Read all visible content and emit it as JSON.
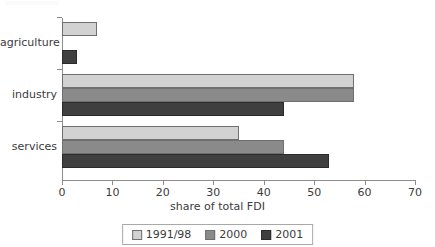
{
  "chart_data": {
    "type": "bar",
    "orientation": "horizontal",
    "title": "",
    "xlabel": "share of total FDI",
    "ylabel": "",
    "categories": [
      "agriculture",
      "industry",
      "services"
    ],
    "series": [
      {
        "name": "1991/98",
        "color": "#d2d2d2",
        "values": [
          7,
          58,
          35
        ]
      },
      {
        "name": "2000",
        "color": "#8a8a8a",
        "values": [
          0,
          58,
          44
        ]
      },
      {
        "name": "2001",
        "color": "#3f3f3f",
        "values": [
          3,
          44,
          53
        ]
      }
    ],
    "xlim": [
      0,
      70
    ],
    "xticks": [
      0,
      10,
      20,
      30,
      40,
      50,
      60,
      70
    ],
    "xtick_labels": [
      "0",
      "10",
      "20",
      "30",
      "40",
      "50",
      "60",
      "70"
    ],
    "grid": false,
    "legend_position": "bottom"
  },
  "axis": {
    "x_title": "share of total FDI"
  },
  "legend": {
    "entries": [
      {
        "label": "1991/98",
        "swatch": "legend-swatch-1991-98"
      },
      {
        "label": "2000",
        "swatch": "legend-swatch-2000"
      },
      {
        "label": "2001",
        "swatch": "legend-swatch-2001"
      }
    ]
  }
}
